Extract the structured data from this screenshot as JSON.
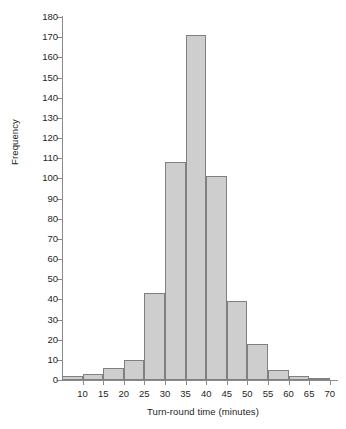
{
  "chart_data": {
    "type": "bar",
    "title": "",
    "subtitle": "",
    "xlabel": "Turn-round time (minutes)",
    "ylabel": "Frequency",
    "xlim": [
      5,
      72
    ],
    "ylim": [
      0,
      180
    ],
    "grid": false,
    "legend": null,
    "bin_width": 5,
    "categories": [
      "5-10",
      "10-15",
      "15-20",
      "20-25",
      "25-30",
      "30-35",
      "35-40",
      "40-45",
      "45-50",
      "50-55",
      "55-60",
      "60-65",
      "65-70"
    ],
    "bin_edges": [
      5,
      10,
      15,
      20,
      25,
      30,
      35,
      40,
      45,
      50,
      55,
      60,
      65,
      70
    ],
    "values": [
      2,
      3,
      6,
      10,
      43,
      108,
      171,
      101,
      39,
      18,
      5,
      2,
      1
    ],
    "xticks": [
      10,
      15,
      20,
      25,
      30,
      35,
      40,
      45,
      50,
      55,
      60,
      65,
      70
    ],
    "xtick_labels": [
      "10",
      "15",
      "20",
      "25",
      "30",
      "35",
      "40",
      "45",
      "50",
      "55",
      "60",
      "65",
      "70"
    ],
    "yticks": [
      0,
      10,
      20,
      30,
      40,
      50,
      60,
      70,
      80,
      90,
      100,
      110,
      120,
      130,
      140,
      150,
      160,
      170,
      180
    ],
    "ytick_labels": [
      "0",
      "10",
      "20",
      "30",
      "40",
      "50",
      "60",
      "70",
      "80",
      "90",
      "100",
      "110",
      "120",
      "130",
      "140",
      "150",
      "160",
      "170",
      "180"
    ],
    "colors": {
      "bar_fill": "#cecece",
      "bar_border": "#808080",
      "axis": "#8a8a8a",
      "text": "#231f20",
      "background": "#ffffff"
    }
  }
}
